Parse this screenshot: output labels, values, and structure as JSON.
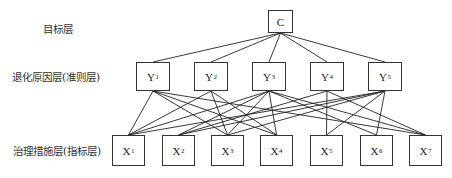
{
  "diagram": {
    "type": "hierarchy",
    "layers": [
      {
        "id": "goal",
        "label": "目标层",
        "nodes": [
          {
            "id": "C",
            "letter": "C",
            "sub": ""
          }
        ]
      },
      {
        "id": "criteria",
        "label": "退化原因层(准则层)",
        "nodes": [
          {
            "id": "Y1",
            "letter": "Y",
            "sub": "1"
          },
          {
            "id": "Y2",
            "letter": "Y",
            "sub": "2"
          },
          {
            "id": "Y3",
            "letter": "Y",
            "sub": "3"
          },
          {
            "id": "Y4",
            "letter": "Y",
            "sub": "4"
          },
          {
            "id": "Y5",
            "letter": "Y",
            "sub": "5"
          }
        ]
      },
      {
        "id": "indicators",
        "label": "治理措施层(指标层)",
        "nodes": [
          {
            "id": "X1",
            "letter": "X",
            "sub": "1"
          },
          {
            "id": "X2",
            "letter": "X",
            "sub": "2"
          },
          {
            "id": "X3",
            "letter": "X",
            "sub": "3"
          },
          {
            "id": "X4",
            "letter": "X",
            "sub": "4"
          },
          {
            "id": "X5",
            "letter": "X",
            "sub": "5"
          },
          {
            "id": "X6",
            "letter": "X",
            "sub": "6"
          },
          {
            "id": "X7",
            "letter": "X",
            "sub": "7"
          }
        ]
      }
    ],
    "edges": [
      [
        "C",
        "Y1"
      ],
      [
        "C",
        "Y2"
      ],
      [
        "C",
        "Y3"
      ],
      [
        "C",
        "Y4"
      ],
      [
        "C",
        "Y5"
      ],
      [
        "Y1",
        "X1"
      ],
      [
        "Y1",
        "X3"
      ],
      [
        "Y1",
        "X4"
      ],
      [
        "Y1",
        "X7"
      ],
      [
        "Y2",
        "X1"
      ],
      [
        "Y2",
        "X3"
      ],
      [
        "Y2",
        "X4"
      ],
      [
        "Y3",
        "X1"
      ],
      [
        "Y3",
        "X2"
      ],
      [
        "Y3",
        "X3"
      ],
      [
        "Y3",
        "X4"
      ],
      [
        "Y3",
        "X6"
      ],
      [
        "Y3",
        "X7"
      ],
      [
        "Y4",
        "X2"
      ],
      [
        "Y4",
        "X5"
      ],
      [
        "Y4",
        "X7"
      ],
      [
        "Y5",
        "X1"
      ],
      [
        "Y5",
        "X2"
      ],
      [
        "Y5",
        "X3"
      ],
      [
        "Y5",
        "X5"
      ],
      [
        "Y5",
        "X6"
      ]
    ]
  }
}
